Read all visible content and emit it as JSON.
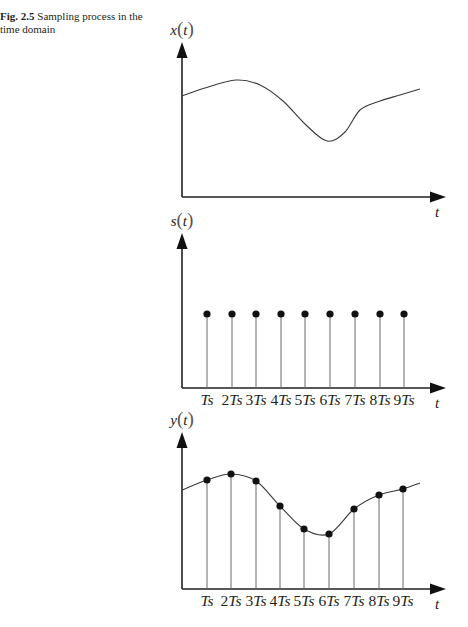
{
  "caption": {
    "figure_label": "Fig. 2.5",
    "text": "Sampling process in the time domain"
  },
  "panels": [
    {
      "id": "x",
      "ylabel": "x(t)",
      "xlabel": "t",
      "origin": [
        182,
        197
      ],
      "ytop": 42,
      "xend": 446,
      "curve": [
        [
          182,
          96
        ],
        [
          205,
          88
        ],
        [
          236,
          80
        ],
        [
          260,
          85
        ],
        [
          283,
          101
        ],
        [
          305,
          124
        ],
        [
          327,
          141
        ],
        [
          345,
          132
        ],
        [
          360,
          110
        ],
        [
          380,
          101
        ],
        [
          400,
          95
        ],
        [
          420,
          89
        ]
      ],
      "stems": [],
      "tick_labels": []
    },
    {
      "id": "s",
      "ylabel": "s(t)",
      "xlabel": "t",
      "origin": [
        182,
        388
      ],
      "ytop": 233,
      "xend": 446,
      "curve": [],
      "stems": [
        [
          207,
          314
        ],
        [
          232,
          314
        ],
        [
          256,
          314
        ],
        [
          281,
          314
        ],
        [
          305,
          314
        ],
        [
          330,
          314
        ],
        [
          355,
          314
        ],
        [
          380,
          314
        ],
        [
          404,
          314
        ]
      ],
      "tick_labels": [
        "Ts",
        "2Ts",
        "3Ts",
        "4Ts",
        "5Ts",
        "6Ts",
        "7Ts",
        "8Ts",
        "9Ts"
      ]
    },
    {
      "id": "y",
      "ylabel": "y(t)",
      "xlabel": "t",
      "origin": [
        182,
        589
      ],
      "ytop": 432,
      "xend": 446,
      "curve": [
        [
          182,
          490
        ],
        [
          207,
          480
        ],
        [
          231,
          474
        ],
        [
          256,
          481
        ],
        [
          280,
          506
        ],
        [
          304,
          529
        ],
        [
          329,
          534
        ],
        [
          354,
          509
        ],
        [
          379,
          495
        ],
        [
          403,
          489
        ],
        [
          420,
          483
        ]
      ],
      "stems": [
        [
          207,
          480
        ],
        [
          231,
          474
        ],
        [
          256,
          481
        ],
        [
          280,
          506
        ],
        [
          304,
          529
        ],
        [
          329,
          534
        ],
        [
          354,
          509
        ],
        [
          379,
          495
        ],
        [
          403,
          489
        ]
      ],
      "tick_labels": [
        "Ts",
        "2Ts",
        "3Ts",
        "4Ts",
        "5Ts",
        "6Ts",
        "7Ts",
        "8Ts",
        "9Ts"
      ]
    }
  ],
  "chart_data": [
    {
      "type": "line",
      "title": "x(t)",
      "xlabel": "t",
      "ylabel": "x(t)",
      "description": "Continuous-time analog signal",
      "x": [
        0,
        0.09,
        0.2,
        0.29,
        0.38,
        0.47,
        0.55,
        0.62,
        0.68,
        0.75,
        0.83,
        0.9
      ],
      "values": [
        0.67,
        0.73,
        0.78,
        0.75,
        0.65,
        0.51,
        0.4,
        0.46,
        0.6,
        0.66,
        0.7,
        0.74
      ],
      "grid": false
    },
    {
      "type": "scatter",
      "title": "s(t)",
      "xlabel": "t",
      "ylabel": "s(t)",
      "description": "Periodic impulse (sampling) train of unit height",
      "categories": [
        "Ts",
        "2Ts",
        "3Ts",
        "4Ts",
        "5Ts",
        "6Ts",
        "7Ts",
        "8Ts",
        "9Ts"
      ],
      "values": [
        1,
        1,
        1,
        1,
        1,
        1,
        1,
        1,
        1
      ],
      "grid": false
    },
    {
      "type": "scatter",
      "title": "y(t)",
      "xlabel": "t",
      "ylabel": "y(t)",
      "description": "Sampled signal: x(t) values at multiples of Ts, shown as stems with underlying continuous curve",
      "categories": [
        "Ts",
        "2Ts",
        "3Ts",
        "4Ts",
        "5Ts",
        "6Ts",
        "7Ts",
        "8Ts",
        "9Ts"
      ],
      "values": [
        0.73,
        0.77,
        0.73,
        0.55,
        0.39,
        0.35,
        0.54,
        0.63,
        0.67
      ],
      "grid": false
    }
  ]
}
